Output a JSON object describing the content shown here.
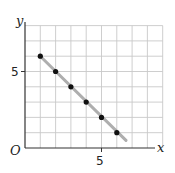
{
  "chart_data": {
    "type": "scatter",
    "title": "",
    "xlabel": "x",
    "ylabel": "y",
    "origin_label": "O",
    "x_ticks": [
      {
        "value": 5,
        "label": "5"
      }
    ],
    "y_ticks": [
      {
        "value": 5,
        "label": "5"
      }
    ],
    "xlim": [
      0,
      9
    ],
    "ylim": [
      0,
      8
    ],
    "grid": true,
    "series": [
      {
        "name": "points",
        "x": [
          1,
          2,
          3,
          4,
          5,
          6
        ],
        "y": [
          6,
          5,
          4,
          3,
          2,
          1
        ]
      }
    ],
    "trend_line": {
      "from": [
        1,
        6
      ],
      "to": [
        6.6,
        0.5
      ],
      "color": "#aaaaaa"
    }
  },
  "labels": {
    "x_axis": "x",
    "y_axis": "y",
    "origin": "O",
    "x_tick_5": "5",
    "y_tick_5": "5"
  },
  "colors": {
    "grid": "#c8c8c8",
    "axis": "#333333",
    "point": "#111111",
    "trend": "#9a9a9a"
  }
}
